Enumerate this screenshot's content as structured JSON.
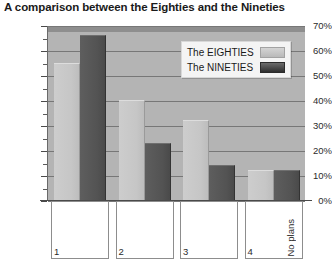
{
  "chart_data": {
    "type": "bar",
    "title": "A comparison between the Eighties and the Nineties",
    "xlabel": "",
    "ylabel": "",
    "categories": [
      "1",
      "2",
      "3",
      "4"
    ],
    "category_extra_labels": [
      "",
      "",
      "",
      "No plans"
    ],
    "series": [
      {
        "name": "The EIGHTIES",
        "values": [
          55,
          40,
          32,
          12
        ],
        "color": "#c6c6c6"
      },
      {
        "name": "The NINETIES",
        "values": [
          66,
          23,
          14,
          12
        ],
        "color": "#535353"
      }
    ],
    "ylim": [
      0,
      70
    ],
    "ytick_values": [
      0,
      10,
      20,
      30,
      40,
      50,
      60,
      70
    ],
    "ytick_labels": [
      "0%",
      "10%",
      "20%",
      "30%",
      "40%",
      "50%",
      "60%",
      "70%"
    ],
    "grid": true,
    "legend_position": "top-right"
  },
  "legend": {
    "entries": [
      {
        "label": "The EIGHTIES"
      },
      {
        "label": "The NINETIES"
      }
    ]
  },
  "colors": {
    "plot_background": "#b4b4b4",
    "gridline": "#777777",
    "axis": "#4a4a4a",
    "series_light": "#c6c6c6",
    "series_dark": "#535353",
    "text": "#1a1a1a"
  }
}
